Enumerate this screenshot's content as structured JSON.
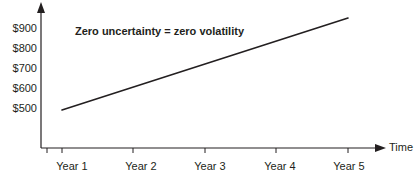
{
  "chart_data": {
    "type": "line",
    "title": "",
    "annotations": [
      {
        "text": "Zero uncertainty = zero volatility",
        "x_px": 75,
        "y_px": 35,
        "bold": true
      }
    ],
    "xlabel": "Time",
    "ylabel": "",
    "categories": [
      "Year 1",
      "Year 2",
      "Year 3",
      "Year 4",
      "Year 5"
    ],
    "x": [
      1,
      2,
      3,
      4,
      5
    ],
    "series": [
      {
        "name": "Certain growth path",
        "values": [
          500,
          600,
          700,
          800,
          900
        ]
      }
    ],
    "ytick_labels": [
      "$900",
      "$800",
      "$700",
      "$600",
      "$500"
    ],
    "ytick_values": [
      900,
      800,
      700,
      600,
      500
    ],
    "ylim": [
      500,
      900
    ],
    "xlim": [
      1,
      5
    ],
    "grid": false,
    "legend": "none",
    "axis_arrows": {
      "x": "right",
      "y": "up"
    },
    "colors": {
      "background": "#ffffff",
      "axis": "#231f20",
      "line": "#231f20",
      "text": "#231f20"
    }
  },
  "geometry": {
    "y_axis_x": 41,
    "x_axis_y": 148,
    "y_axis_top": 6,
    "x_axis_right": 385,
    "ytick_y": [
      28,
      48,
      68,
      88,
      108
    ],
    "xtick_x": [
      62,
      133,
      205,
      276,
      348
    ],
    "xlabel_center_x": [
      72,
      141,
      210,
      280,
      349
    ],
    "xlabel_y": 166,
    "ylabel_right_x": 37,
    "line_start": {
      "x": 62,
      "y": 110
    },
    "line_end": {
      "x": 348,
      "y": 18
    },
    "axis_name_x": 389,
    "axis_name_y": 151
  }
}
